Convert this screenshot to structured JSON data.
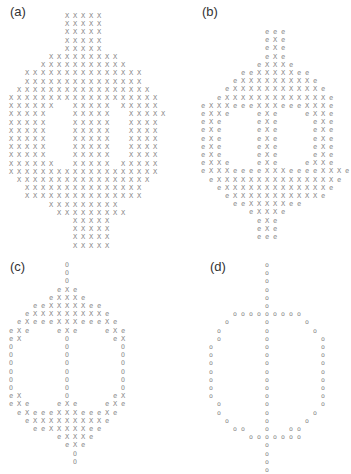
{
  "figure": {
    "panels": [
      {
        "label": "(a)",
        "label_pos": [
          10,
          4
        ],
        "origin": [
          11,
          16
        ],
        "rows": [
          "       XXXXX       ",
          "       XXXXX       ",
          "       XXXXX       ",
          "       XXXXX       ",
          "       XXXXX       ",
          "     XXXXXXXXX     ",
          "    XXXXXXXXXXX    ",
          "  XXXXXXXXXXXXXXX  ",
          "  XXXXXXXXXXXXXXX  ",
          " XXXXXXXXXXXXXXXXX ",
          "XXXXXXXXXXXXXXXXXXX",
          "XXXXXX  XXXXX XXXXX",
          "XXXXX   XXXXX  XXXXX",
          "XXXXX   XXXXX  XXXX",
          "XXXXX   XXXXX  XXXX",
          "XXXXX   XXXXX  XXXX",
          "XXXXX   XXXXX  XXXX",
          "XXXXX   XXXXX  XXXX",
          "XXXXXX  XXXXX XXXXX",
          "XXXXXXXXXXXXXXXXXXX",
          " XXXXXXXXXXXXXXXXX ",
          "  XXXXXXXXXXXXXXX  ",
          "  XXXXXXXXXXXXXXX  ",
          "     XXXXXXXXX     ",
          "      XXXXXXXXX    ",
          "        XXXXX      ",
          "        XXXXX      ",
          "        XXXXX      ",
          "        XXXXX      "
        ]
      },
      {
        "label": "(b)",
        "label_pos": [
          202,
          4
        ],
        "origin": [
          203,
          32
        ],
        "rows": [
          "        eee        ",
          "        eXe        ",
          "        eXe        ",
          "        eXe        ",
          "       eXXXe       ",
          "     eeXXXXXee     ",
          "    eXXXXXXXXXe    ",
          "   eXXXXXXXXXXXe   ",
          "  eXXXXXXXXXXXXXe  ",
          "eXXXeeeXXXeeeXXXe  ",
          "eXXe   eXe   eXXe  ",
          "eXe    eXe    eXe  ",
          "eXe    eXe    eXe  ",
          "eXe    eXe    eXe  ",
          "eXe    eXe    eXe  ",
          "eXe    eXe    eXe  ",
          "eXXe   eXe   eXXe  ",
          "eXXXeeeeXXXeeeeXXXe",
          " eXXXXXXXXXXXXXXXe ",
          "  eXXXXXXXXXXXXXe  ",
          "   eXXXXXXXXXXXe   ",
          "    eeXXXXXee      ",
          "      eXXXe        ",
          "       eXe         ",
          "       eXe         ",
          "       eee         "
        ]
      },
      {
        "label": "(c)",
        "label_pos": [
          10,
          259
        ],
        "origin": [
          11,
          265
        ],
        "rows": [
          "       O           ",
          "       O           ",
          "       O           ",
          "      eXe          ",
          "     eXXXe         ",
          "   eeXXXXXee       ",
          "  eXXXXXXXXXe      ",
          " eXeeeXXXeeeXe     ",
          "eXe   eXe   eXe    ",
          "eX     O     eX    ",
          "O      O      O    ",
          "O      O      O    ",
          "O      O      O    ",
          "O      O      O    ",
          "O      O      O    ",
          "O      O      O    ",
          "eX     O     eX    ",
          "eXe   eXe   eXe    ",
          " eXeeeXXXeeeXe     ",
          "  eXXXXXXXXXe      ",
          "   eeXXXXXee       ",
          "      eXXXe        ",
          "       eXe         ",
          "        O          ",
          "        O          "
        ]
      },
      {
        "label": "(d)",
        "label_pos": [
          210,
          259
        ],
        "origin": [
          211,
          265
        ],
        "rows": [
          "       o           ",
          "       o           ",
          "       o           ",
          "       o           ",
          "       o           ",
          "       o           ",
          "   ooooooooo       ",
          "  o    o    o      ",
          " o     o     o     ",
          " o     o      o    ",
          "o      o      o    ",
          "o      o      o    ",
          "o      o      o    ",
          "o      o      o    ",
          "o      o      o    ",
          "o      o      o    ",
          "o      o      o    ",
          " o     o      o    ",
          " o     o     o     ",
          "  o    o    o      ",
          "   oo  o  oo       ",
          "     ooooooo       ",
          "       o           ",
          "       o           ",
          "       o           ",
          "       o           "
        ]
      }
    ],
    "legend": {
      "X": "foreground pixel",
      "e": "eroded/boundary pixel",
      "O": "skeleton pixel"
    },
    "grid": {
      "cell_w": 8,
      "cell_h": 8.2
    }
  }
}
